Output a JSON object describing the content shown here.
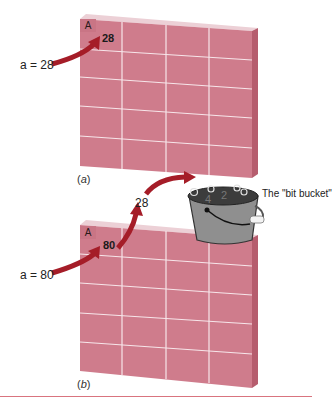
{
  "figure": {
    "panel_a": {
      "caption_open": "(",
      "caption_letter": "a",
      "caption_close": ")",
      "cell_tag": "A",
      "cell_value": "28",
      "assignment": "a = 28"
    },
    "panel_b": {
      "caption_open": "(",
      "caption_letter": "b",
      "caption_close": ")",
      "cell_tag": "A",
      "cell_value": "80",
      "assignment": "a = 80",
      "discarded_value": "28",
      "bucket_label": "The \"bit bucket\"",
      "bucket_digits": [
        "4",
        "2"
      ]
    },
    "colors": {
      "grid_face": "#cf7c8c",
      "grid_side": "#b85f70",
      "grid_top": "#e9c3cb",
      "grid_lines": "#f6e4e8",
      "arrow": "#a51d28",
      "bucket_body": "#8e8e8e",
      "bucket_rim": "#3a3a3a",
      "rule": "#d9747f"
    }
  }
}
